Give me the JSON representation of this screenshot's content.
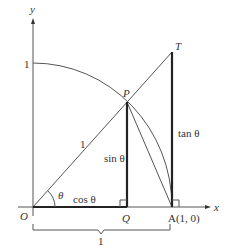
{
  "diagram": {
    "axes": {
      "x_label": "x",
      "y_label": "y",
      "y_tick_label": "1"
    },
    "points": {
      "origin": "O",
      "P": "P",
      "T": "T",
      "Q": "Q",
      "A": "A(1, 0)"
    },
    "segments": {
      "radius": "1",
      "cos": "cos θ",
      "sin": "sin θ",
      "tan": "tan θ",
      "angle": "θ"
    },
    "brace_label": "1",
    "colors": {
      "stroke": "#555555",
      "bold_stroke": "#222222",
      "text": "#333333"
    }
  }
}
